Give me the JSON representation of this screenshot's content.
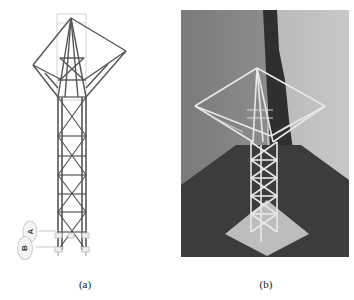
{
  "figure": {
    "panels": [
      {
        "id": "a",
        "caption": "(a)",
        "kind": "structural-model-drawing",
        "description": "Line drawing of a lattice tower with inverted-pyramid top and square frame",
        "labels": [
          {
            "text": "A"
          },
          {
            "text": "B"
          }
        ],
        "colors": {
          "member": "#555555",
          "guide": "#cccccc",
          "label_fill": "#f2f2f2"
        }
      },
      {
        "id": "b",
        "caption": "(b)",
        "kind": "photograph",
        "description": "Photo of physical lattice tower model on square base plate",
        "colors": {
          "wall": "#8f8f8f",
          "floor": "#3a3a3a",
          "model": "#e6e6e6",
          "shadow": "#2e2e2e"
        }
      }
    ]
  }
}
